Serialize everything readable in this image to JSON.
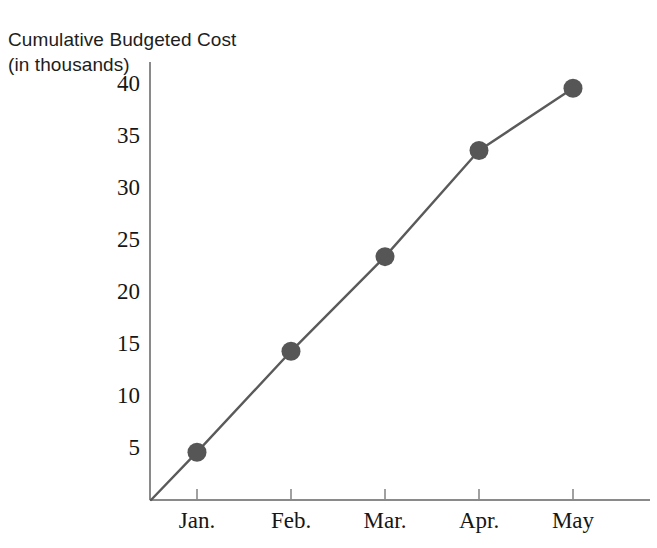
{
  "chart_data": {
    "type": "line",
    "title": "Cumulative Budgeted Cost",
    "subtitle": "(in thousands)",
    "xlabel": "",
    "ylabel": "",
    "categories": [
      "Jan.",
      "Feb.",
      "Mar.",
      "Apr.",
      "May"
    ],
    "values": [
      4.6,
      14.3,
      23.4,
      33.6,
      39.6
    ],
    "series": [
      {
        "name": "Cumulative Budgeted Cost",
        "values": [
          4.6,
          14.3,
          23.4,
          33.6,
          39.6
        ]
      }
    ],
    "y_ticks": [
      5,
      10,
      15,
      20,
      25,
      30,
      35,
      40
    ],
    "y_tick_labels": [
      "5",
      "10",
      "15",
      "20",
      "25",
      "30",
      "35",
      "40"
    ],
    "x_tick_labels": [
      "Jan.",
      "Feb.",
      "Mar.",
      "Apr.",
      "May"
    ],
    "ylim": [
      0,
      42.5
    ],
    "xlim": [
      0,
      5.85
    ],
    "grid": false,
    "legend": false,
    "legend_position": "none",
    "origin_anchored": true,
    "colors": {
      "line": "#5a5a5a",
      "marker": "#565656",
      "axis": "#7a7a7a",
      "text": "#161616"
    }
  },
  "axes": {
    "y_axis_name": "value-axis",
    "x_axis_name": "category-axis"
  }
}
